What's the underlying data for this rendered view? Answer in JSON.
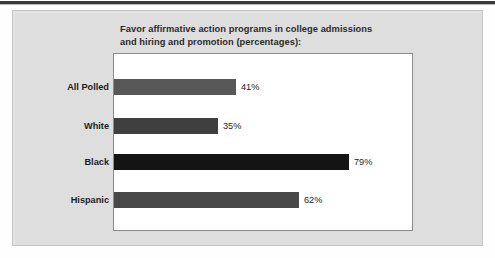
{
  "figure": {
    "title_line_1": "Favor affirmative action programs in college admissions",
    "title_line_2": "and hiring and promotion (percentages):"
  },
  "chart_data": {
    "type": "bar",
    "orientation": "horizontal",
    "title": "Favor affirmative action programs in college admissions and hiring and promotion (percentages):",
    "xlabel": "",
    "ylabel": "",
    "xlim": [
      0,
      100
    ],
    "grid": false,
    "legend": null,
    "categories": [
      "All Polled",
      "White",
      "Black",
      "Hispanic"
    ],
    "values": [
      41,
      35,
      79,
      62
    ],
    "value_labels": [
      "41%",
      "35%",
      "79%",
      "62%"
    ],
    "bar_colors": [
      "#575757",
      "#3f3f3f",
      "#141414",
      "#484848"
    ]
  }
}
